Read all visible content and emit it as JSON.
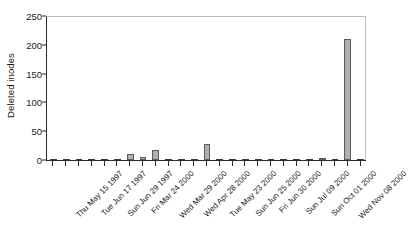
{
  "chart_data": {
    "type": "bar",
    "title": "",
    "subtitle": "",
    "xlabel": "",
    "ylabel": "Deleted inodes",
    "ylim": [
      0,
      250
    ],
    "yticks": [
      0,
      50,
      100,
      150,
      200,
      250
    ],
    "grid": false,
    "legend": null,
    "bar_color": "#b0b0b0",
    "bar_edge_color": "#5a5a5a",
    "axis_color": "#2a2a2a",
    "categories": [
      "Thu May 15 1997",
      "Fri May 30 1997",
      "Tue Jun 17 1997",
      "Wed Jun 25 1997",
      "Sun Jun 29 1997",
      "Mon Mar 13 2000",
      "Fri Mar 24 2000",
      "Sat Mar 25 2000",
      "Wed Mar 29 2000",
      "Mon Apr 17 2000",
      "Wed Apr 28 2000",
      "Tue May 09 2000",
      "Tue May 23 2000",
      "Thu Jun 08 2000",
      "Sun Jun 25 2000",
      "Tue Jun 27 2000",
      "Fri Jun 30 2000",
      "Mon Jul 03 2000",
      "Sun Jul 09 2000",
      "Thu Aug 17 2000",
      "Sun Oct 01 2000",
      "Wed Oct 18 2000",
      "Sun Nov 05 2000",
      "Wed Nov 08 2000",
      "Thu Nov 09 2000"
    ],
    "labeled_ticks": [
      "Thu May 15 1997",
      "Tue Jun 17 1997",
      "Sun Jun 29 1997",
      "Fri Mar 24 2000",
      "Wed Mar 29 2000",
      "Wed Apr 28 2000",
      "Tue May 23 2000",
      "Sun Jun 25 2000",
      "Fri Jun 30 2000",
      "Sun Jul 09 2000",
      "Sun Oct 01 2000",
      "Wed Nov 08 2000"
    ],
    "values": [
      1,
      1,
      1,
      1,
      1,
      1,
      11,
      6,
      17,
      1,
      1,
      1,
      28,
      1,
      1,
      1,
      1,
      1,
      1,
      1,
      2,
      4,
      1,
      210,
      1
    ]
  }
}
